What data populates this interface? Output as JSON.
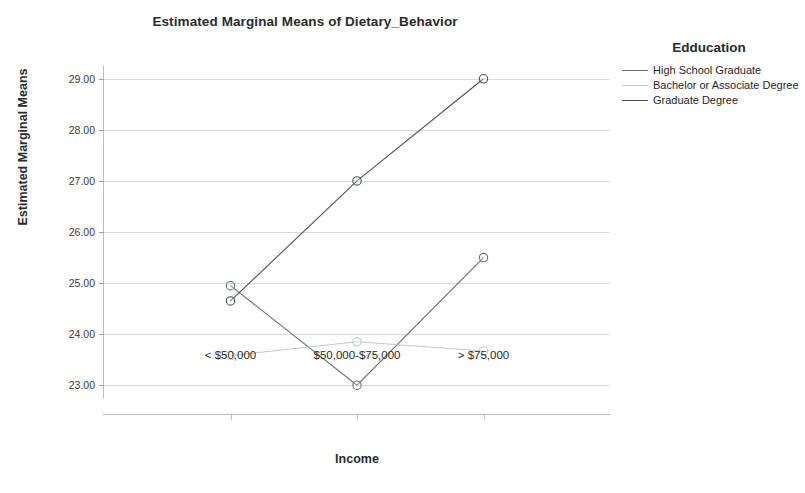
{
  "chart_data": {
    "type": "line",
    "title": "Estimated Marginal Means of Dietary_Behavior",
    "xlabel": "Income",
    "ylabel": "Estimated Marginal Means",
    "categories": [
      "< $50,000",
      "$50,000-$75,000",
      "> $75,000"
    ],
    "ytick_labels": [
      "29.00",
      "28.00",
      "27.00",
      "26.00",
      "25.00",
      "24.00",
      "23.00"
    ],
    "yticks": [
      29.0,
      28.0,
      27.0,
      26.0,
      25.0,
      24.0,
      23.0
    ],
    "ylim": [
      22.75,
      29.25
    ],
    "grid": true,
    "legend_position": "right",
    "legend_title": "Edducation",
    "series": [
      {
        "name": "High School Graduate",
        "values": [
          24.95,
          23.0,
          25.5
        ],
        "color": "#6a6f78",
        "marker": "circle-open"
      },
      {
        "name": "Bachelor or Associate Degree",
        "values": [
          23.58,
          23.85,
          23.67
        ],
        "color": "#c3c7cc",
        "marker": "circle-open"
      },
      {
        "name": "Graduate Degree",
        "values": [
          24.65,
          27.0,
          29.0
        ],
        "color": "#4b5058",
        "marker": "circle-open"
      }
    ]
  },
  "colors": {
    "gridline": "#d9dde3",
    "axis": "#b8bdc4",
    "text": "#2b2b2b",
    "background": "#ffffff"
  }
}
